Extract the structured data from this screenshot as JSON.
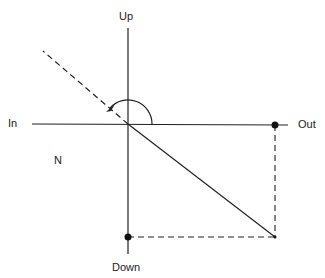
{
  "diagram": {
    "labels": {
      "up": "Up",
      "down": "Down",
      "in": "In",
      "out": "Out",
      "n": "N"
    },
    "colors": {
      "ink": "#222222",
      "background": "#ffffff"
    }
  }
}
